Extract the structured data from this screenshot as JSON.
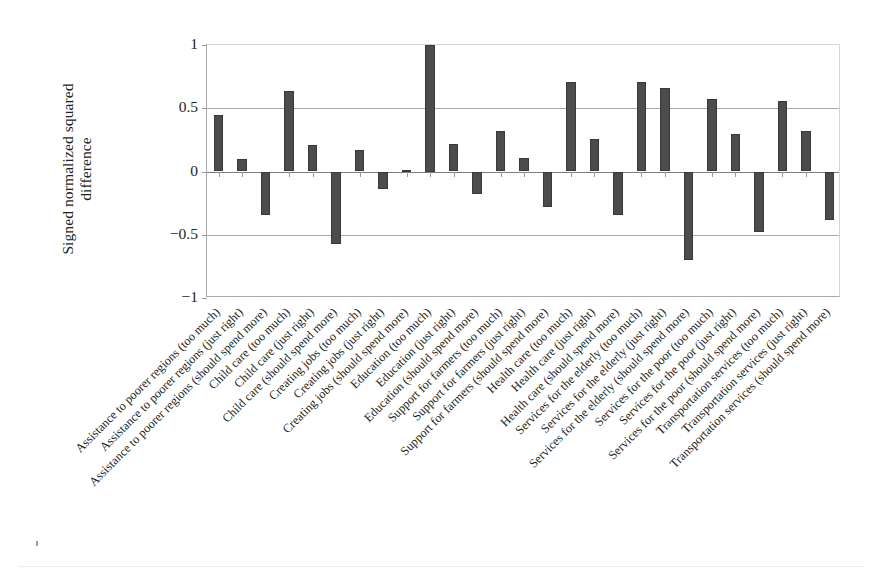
{
  "chart_data": {
    "type": "bar",
    "title": "",
    "subtitle": "",
    "xlabel": "",
    "ylabel": "Signed normalized squared\ndifference",
    "ylabel_lines": [
      "Signed normalized squared",
      "difference"
    ],
    "ylim": [
      -1,
      1
    ],
    "yticks": [
      1,
      0.5,
      0,
      -0.5,
      -1
    ],
    "ytick_labels": [
      "1",
      "0.5",
      "0",
      "−0.5",
      "−1"
    ],
    "grid": true,
    "grid_axis": "y",
    "legend": "none",
    "bar_color": "#4d4b4c",
    "bar_edge_color": "#3a3839",
    "categories": [
      "Assistance to poorer regions (too much)",
      "Assistance to poorer regions (just right)",
      "Assistance to poorer regions (should spend more)",
      "Child care (too much)",
      "Child care (just right)",
      "Child care (should spend more)",
      "Creating jobs (too much)",
      "Creating jobs (just right)",
      "Creating jobs (should spend more)",
      "Education (too much)",
      "Education (just right)",
      "Education (should spend more)",
      "Support for farmers (too much)",
      "Support for farmers (just right)",
      "Support for farmers (should spend more)",
      "Health care (too much)",
      "Health care (just right)",
      "Health care (should spend more)",
      "Services for the elderly (too much)",
      "Services for the elderly (just right)",
      "Services for the elderly (should spend more)",
      "Services for the poor (too much)",
      "Services for the poor (just right)",
      "Services for the poor (should spend more)",
      "Transportation services (too much)",
      "Transportation services (just right)",
      "Transportation services (should spend more)"
    ],
    "values": [
      0.45,
      0.1,
      -0.34,
      0.64,
      0.21,
      -0.57,
      0.17,
      -0.14,
      0.01,
      1.0,
      0.22,
      -0.18,
      0.32,
      0.11,
      -0.28,
      0.71,
      0.26,
      -0.34,
      0.71,
      0.66,
      -0.7,
      0.57,
      0.3,
      -0.48,
      0.56,
      0.32,
      -0.38
    ]
  }
}
